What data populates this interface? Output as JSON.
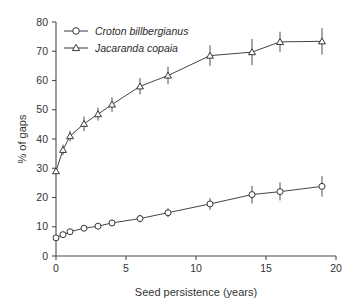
{
  "chart_data": {
    "type": "line",
    "title": "",
    "subtitle": "",
    "xlabel": "Seed persistence (years)",
    "ylabel": "% of gaps",
    "xlim": [
      0,
      20
    ],
    "ylim": [
      0,
      80
    ],
    "xticks": [
      0,
      5,
      10,
      15,
      20
    ],
    "xtick_labels": [
      "0",
      "5",
      "10",
      "15",
      "20"
    ],
    "yticks": [
      0,
      10,
      20,
      30,
      40,
      50,
      60,
      70,
      80
    ],
    "ytick_labels": [
      "0",
      "10",
      "20",
      "30",
      "40",
      "50",
      "60",
      "70",
      "80"
    ],
    "grid": false,
    "legend_position": "top-left",
    "error_bars": "vertical",
    "series": [
      {
        "name": "Croton billbergianus",
        "marker": "open-circle",
        "x": [
          0,
          0.5,
          1,
          2,
          3,
          4,
          6,
          8,
          11,
          14,
          16,
          19
        ],
        "values": [
          6.2,
          7.3,
          8.3,
          9.5,
          10.2,
          11.3,
          12.8,
          14.8,
          17.8,
          21.0,
          22.0,
          23.8
        ],
        "err_low": [
          1.0,
          0.8,
          0.8,
          0.9,
          1.0,
          1.0,
          1.3,
          1.5,
          2.0,
          3.0,
          3.0,
          3.5
        ],
        "err_high": [
          1.0,
          0.8,
          0.8,
          0.9,
          1.0,
          1.0,
          1.3,
          1.5,
          2.0,
          3.0,
          3.2,
          3.5
        ]
      },
      {
        "name": "Jacaranda copaia",
        "marker": "open-triangle",
        "x": [
          0,
          0.5,
          1,
          2,
          3,
          4,
          6,
          8,
          11,
          14,
          16,
          19
        ],
        "values": [
          29.0,
          36.3,
          41.0,
          45.2,
          48.5,
          51.8,
          58.0,
          61.7,
          68.5,
          69.7,
          73.2,
          73.4
        ],
        "err_low": [
          0.8,
          1.8,
          1.8,
          2.5,
          2.2,
          2.5,
          2.8,
          3.0,
          3.5,
          4.5,
          3.5,
          4.5
        ],
        "err_high": [
          0.8,
          1.8,
          1.8,
          2.5,
          2.2,
          2.5,
          2.8,
          3.0,
          3.5,
          4.5,
          3.5,
          4.5
        ]
      }
    ]
  },
  "axes": {
    "x_title": "Seed persistence (years)",
    "y_title": "% of gaps"
  },
  "legend": {
    "items": [
      {
        "label": "Croton billbergianus",
        "marker": "open-circle"
      },
      {
        "label": "Jacaranda copaia",
        "marker": "open-triangle"
      }
    ]
  },
  "colors": {
    "axis": "#4a4a4a",
    "series_line": "#3a3a3a",
    "marker_fill": "#ffffff",
    "marker_stroke": "#2b2b2b",
    "background": "#ffffff"
  }
}
